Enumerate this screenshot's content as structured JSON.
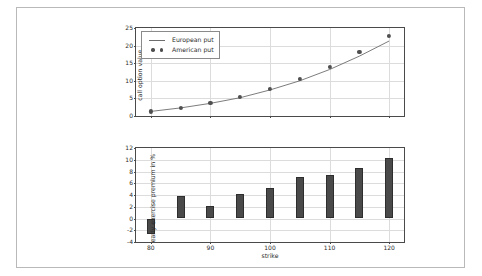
{
  "chart_data": [
    {
      "id": "top",
      "type": "line",
      "title": "",
      "xlabel": "",
      "ylabel": "call option value",
      "xlim": [
        77.5,
        122.5
      ],
      "ylim": [
        0,
        25
      ],
      "xticks": [
        80,
        90,
        100,
        110,
        120
      ],
      "yticks": [
        0,
        5,
        10,
        15,
        20,
        25
      ],
      "grid": true,
      "legend_position": "upper left",
      "x": [
        80,
        85,
        90,
        95,
        100,
        105,
        110,
        115,
        120
      ],
      "series": [
        {
          "name": "European put",
          "style": "line",
          "values": [
            1.3,
            2.3,
            3.6,
            5.2,
            7.4,
            10.0,
            13.2,
            17.0,
            21.3
          ]
        },
        {
          "name": "American put",
          "style": "markers",
          "values": [
            1.3,
            2.4,
            3.7,
            5.4,
            7.7,
            10.5,
            14.0,
            18.2,
            22.8
          ]
        }
      ]
    },
    {
      "id": "bottom",
      "type": "bar",
      "title": "",
      "xlabel": "strike",
      "ylabel": "early exercise premium in %",
      "xlim": [
        77.5,
        122.5
      ],
      "ylim": [
        -4,
        12
      ],
      "xticks": [
        80,
        90,
        100,
        110,
        120
      ],
      "yticks": [
        -4,
        -2,
        0,
        2,
        4,
        6,
        8,
        10,
        12
      ],
      "grid": true,
      "categories": [
        80,
        85,
        90,
        95,
        100,
        105,
        110,
        115,
        120
      ],
      "values": [
        -2.6,
        3.8,
        2.2,
        4.1,
        5.2,
        7.1,
        7.4,
        8.6,
        10.3
      ]
    }
  ],
  "legend": {
    "items": [
      {
        "label": "European put",
        "key": "line"
      },
      {
        "label": "American put",
        "key": "markers"
      }
    ]
  }
}
